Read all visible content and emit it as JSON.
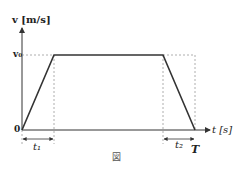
{
  "figure": {
    "y_axis_label": "v [m/s]",
    "x_axis_label": "t [s]",
    "origin_label": "0",
    "v0_label": "v₀",
    "t1_label": "t₁",
    "t2_label": "t₂",
    "T_label": "T",
    "caption": "図",
    "line_color": "#333333",
    "guide_color": "#999999"
  }
}
